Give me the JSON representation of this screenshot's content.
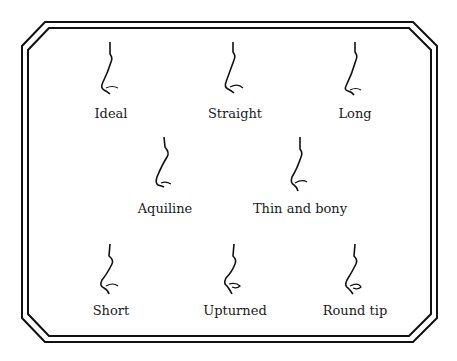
{
  "colors": {
    "line": "#111111",
    "background": "#ffffff"
  },
  "items": [
    {
      "label": "Ideal",
      "shape": "ideal"
    },
    {
      "label": "Straight",
      "shape": "straight"
    },
    {
      "label": "Long",
      "shape": "long"
    },
    {
      "label": "Aquiline",
      "shape": "aquiline"
    },
    {
      "label": "Thin and bony",
      "shape": "thin-and-bony"
    },
    {
      "label": "Short",
      "shape": "short"
    },
    {
      "label": "Upturned",
      "shape": "upturned"
    },
    {
      "label": "Round tip",
      "shape": "round-tip"
    }
  ]
}
